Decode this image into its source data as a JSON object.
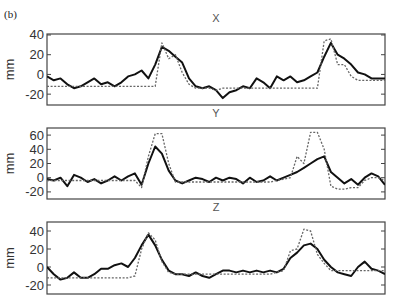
{
  "figure_label": "(b)",
  "chart_data": [
    {
      "type": "line",
      "title": "X",
      "xlabel": "",
      "ylabel": "mm",
      "yticks": [
        40,
        20,
        0,
        -20
      ],
      "ylim": [
        -31,
        41
      ],
      "xlim": [
        0,
        100
      ],
      "grid": false,
      "x": [
        0,
        2,
        4,
        6,
        8,
        10,
        12,
        14,
        16,
        18,
        20,
        22,
        24,
        26,
        28,
        30,
        32,
        34,
        36,
        38,
        40,
        42,
        44,
        46,
        48,
        50,
        52,
        54,
        56,
        58,
        60,
        62,
        64,
        66,
        68,
        70,
        72,
        74,
        76,
        78,
        80,
        82,
        84,
        86,
        88,
        90,
        92,
        94,
        96,
        98,
        100
      ],
      "series": [
        {
          "name": "measured",
          "style": "solid",
          "values": [
            -2,
            -6,
            -4,
            -10,
            -14,
            -12,
            -8,
            -4,
            -10,
            -8,
            -12,
            -8,
            -2,
            0,
            4,
            -4,
            10,
            28,
            24,
            18,
            12,
            -4,
            -12,
            -14,
            -12,
            -16,
            -24,
            -18,
            -16,
            -12,
            -14,
            -4,
            -8,
            -14,
            -2,
            -6,
            -2,
            -8,
            -6,
            -2,
            2,
            18,
            32,
            20,
            16,
            10,
            2,
            0,
            -4,
            -4,
            -4
          ]
        },
        {
          "name": "reference",
          "style": "dotted",
          "values": [
            -12,
            -12,
            -12,
            -12,
            -12,
            -12,
            -12,
            -12,
            -12,
            -12,
            -12,
            -12,
            -12,
            -12,
            -12,
            -12,
            -12,
            32,
            16,
            20,
            2,
            -10,
            -14,
            -14,
            -14,
            -16,
            -14,
            -14,
            -14,
            -14,
            -14,
            -14,
            -14,
            -14,
            -14,
            -14,
            -14,
            -14,
            -14,
            -14,
            -14,
            34,
            36,
            10,
            10,
            -2,
            -6,
            -6,
            -6,
            -6,
            -6
          ]
        }
      ]
    },
    {
      "type": "line",
      "title": "Y",
      "xlabel": "",
      "ylabel": "mm",
      "yticks": [
        60,
        40,
        20,
        0,
        -20
      ],
      "ylim": [
        -30,
        70
      ],
      "xlim": [
        0,
        100
      ],
      "grid": false,
      "x": [
        0,
        2,
        4,
        6,
        8,
        10,
        12,
        14,
        16,
        18,
        20,
        22,
        24,
        26,
        28,
        30,
        32,
        34,
        36,
        38,
        40,
        42,
        44,
        46,
        48,
        50,
        52,
        54,
        56,
        58,
        60,
        62,
        64,
        66,
        68,
        70,
        72,
        74,
        76,
        78,
        80,
        82,
        84,
        86,
        88,
        90,
        92,
        94,
        96,
        98,
        100
      ],
      "series": [
        {
          "name": "measured",
          "style": "solid",
          "values": [
            -2,
            -4,
            0,
            -12,
            4,
            0,
            -6,
            -2,
            -8,
            -4,
            2,
            -4,
            2,
            6,
            -10,
            20,
            44,
            34,
            10,
            -4,
            -8,
            -4,
            0,
            -2,
            -6,
            0,
            -4,
            0,
            -2,
            -8,
            0,
            -6,
            -4,
            2,
            -4,
            0,
            4,
            8,
            14,
            20,
            26,
            30,
            8,
            0,
            -8,
            -2,
            -10,
            0,
            6,
            2,
            -10
          ]
        },
        {
          "name": "reference",
          "style": "dotted",
          "values": [
            -4,
            -4,
            -4,
            -4,
            -4,
            -4,
            -4,
            -4,
            -4,
            -4,
            -4,
            -4,
            -4,
            -4,
            -14,
            30,
            62,
            62,
            20,
            -6,
            -6,
            -6,
            -6,
            -6,
            -6,
            -6,
            -6,
            -6,
            -6,
            -6,
            -6,
            -6,
            -6,
            -6,
            -4,
            -2,
            0,
            30,
            20,
            64,
            64,
            40,
            -12,
            -16,
            -16,
            -14,
            -14,
            -4,
            0,
            0,
            -4
          ]
        }
      ]
    },
    {
      "type": "line",
      "title": "Z",
      "xlabel": "",
      "ylabel": "mm",
      "yticks": [
        40,
        20,
        0,
        -20
      ],
      "ylim": [
        -30,
        50
      ],
      "xlim": [
        0,
        100
      ],
      "grid": false,
      "x": [
        0,
        2,
        4,
        6,
        8,
        10,
        12,
        14,
        16,
        18,
        20,
        22,
        24,
        26,
        28,
        30,
        32,
        34,
        36,
        38,
        40,
        42,
        44,
        46,
        48,
        50,
        52,
        54,
        56,
        58,
        60,
        62,
        64,
        66,
        68,
        70,
        72,
        74,
        76,
        78,
        80,
        82,
        84,
        86,
        88,
        90,
        92,
        94,
        96,
        98,
        100
      ],
      "series": [
        {
          "name": "measured",
          "style": "solid",
          "values": [
            0,
            -8,
            -14,
            -12,
            -6,
            -12,
            -12,
            -8,
            -2,
            -2,
            2,
            4,
            0,
            10,
            24,
            36,
            24,
            8,
            -4,
            -8,
            -8,
            -10,
            -6,
            -10,
            -12,
            -8,
            -4,
            -4,
            -6,
            -4,
            -6,
            -4,
            -6,
            -4,
            -6,
            -2,
            10,
            16,
            24,
            26,
            20,
            8,
            0,
            -6,
            -8,
            -10,
            0,
            6,
            -2,
            -4,
            -8
          ]
        },
        {
          "name": "reference",
          "style": "dotted",
          "values": [
            -12,
            -12,
            -12,
            -12,
            -12,
            -12,
            -12,
            -12,
            -12,
            -12,
            -12,
            -12,
            -12,
            -10,
            20,
            38,
            30,
            6,
            -6,
            -8,
            -8,
            -8,
            -8,
            -8,
            -8,
            -8,
            -8,
            -8,
            -8,
            -8,
            -8,
            -8,
            -8,
            -8,
            -6,
            -4,
            18,
            20,
            42,
            40,
            14,
            4,
            -4,
            -4,
            -4,
            -4,
            -4,
            -4,
            -4,
            -4,
            -4
          ]
        }
      ]
    }
  ]
}
